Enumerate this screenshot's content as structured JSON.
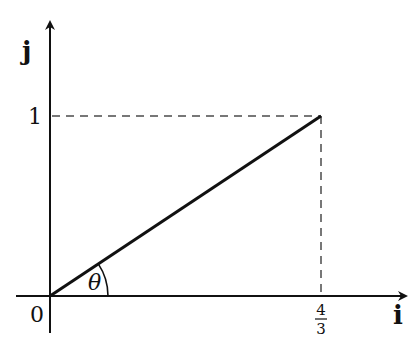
{
  "diagram": {
    "type": "vector-angle-diagram",
    "axes": {
      "x_label": "i",
      "y_label": "j",
      "origin_label": "0"
    },
    "ticks": {
      "y_tick_label": "1",
      "x_tick_numerator": "4",
      "x_tick_denominator": "3"
    },
    "vector": {
      "from": [
        0,
        0
      ],
      "to": [
        "4/3",
        1
      ]
    },
    "angle_label": "θ",
    "colors": {
      "line": "#111111",
      "dashed": "#777777",
      "background": "#ffffff"
    }
  }
}
